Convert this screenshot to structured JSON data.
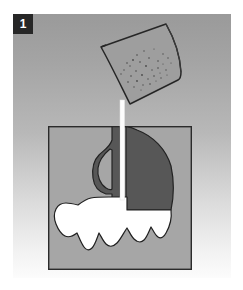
{
  "figure": {
    "step_number": "1",
    "caption": "",
    "type": "instructional-step-illustration"
  },
  "colors": {
    "panel_gradient_top": "#9d9d9d",
    "panel_gradient_bottom": "#fbfbfb",
    "badge_background": "#272727",
    "badge_text": "#ffffff",
    "container_fill": "#a6a6a6",
    "container_outline": "#2b2b2b",
    "bucket_fill": "#9e9e9e",
    "bucket_outline": "#262626",
    "dark_material": "#575757",
    "light_material": "#ffffff",
    "stream": "#fdfdfd",
    "page_background": "#ffffff",
    "speckle": "#4a4a4a"
  },
  "panel": {
    "x": 13,
    "y": 14,
    "width": 218,
    "height": 264
  },
  "bucket": {
    "label": "tilted-pouring-bucket",
    "rotation_deg": -28,
    "rim_side": "right",
    "spout_point": {
      "x": 127,
      "y": 103
    },
    "speckle_count": 34,
    "outline": "M 101,47 L 164,24 C 172,38 178,56 178,72 L 133,103 C 122,86 109,63 101,47 Z"
  },
  "stream": {
    "label": "pour-stream",
    "from": {
      "x": 127,
      "y": 103
    },
    "to": {
      "x": 122,
      "y": 198
    },
    "width_px": 4
  },
  "container": {
    "label": "sectioned-container",
    "x": 48,
    "y": 126,
    "width": 144,
    "height": 144,
    "outline_width": 1.4
  },
  "regions": [
    {
      "name": "dark-material-layer",
      "fill": "#575757",
      "description": "dark aggregate filling upper cavity with curved right edge"
    },
    {
      "name": "handle-loop-void",
      "fill": "#a6a6a6",
      "description": "teardrop void left of the pour column"
    },
    {
      "name": "light-material-layer",
      "fill": "#ffffff",
      "description": "irregular white fill spanning lower container"
    }
  ],
  "speckles": [
    [
      137,
      55
    ],
    [
      144,
      51
    ],
    [
      149,
      58
    ],
    [
      154,
      49
    ],
    [
      158,
      61
    ],
    [
      163,
      54
    ],
    [
      140,
      62
    ],
    [
      146,
      66
    ],
    [
      152,
      70
    ],
    [
      158,
      68
    ],
    [
      163,
      64
    ],
    [
      168,
      58
    ],
    [
      133,
      60
    ],
    [
      130,
      66
    ],
    [
      136,
      71
    ],
    [
      142,
      75
    ],
    [
      148,
      79
    ],
    [
      154,
      76
    ],
    [
      160,
      73
    ],
    [
      166,
      70
    ],
    [
      171,
      63
    ],
    [
      127,
      63
    ],
    [
      124,
      70
    ],
    [
      131,
      76
    ],
    [
      137,
      81
    ],
    [
      143,
      85
    ],
    [
      150,
      84
    ],
    [
      156,
      81
    ],
    [
      161,
      78
    ],
    [
      167,
      75
    ],
    [
      121,
      74
    ],
    [
      128,
      82
    ],
    [
      134,
      87
    ],
    [
      141,
      90
    ]
  ]
}
